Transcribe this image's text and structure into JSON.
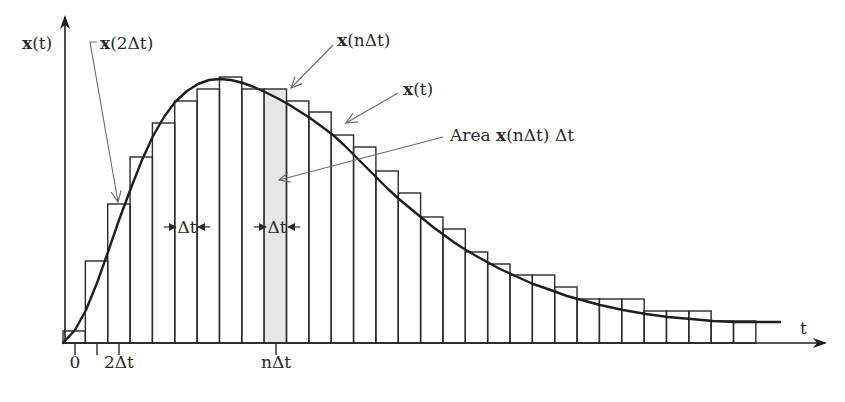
{
  "figure": {
    "colors": {
      "stroke": "#2a2a2a",
      "curve": "#1e1e1e",
      "leader": "#6a6a6a",
      "highlight_fill": "#e6e6e6",
      "background": "#ffffff"
    },
    "axes": {
      "y_label_bold": "x",
      "y_label_rest": "(t)",
      "x_label": "t",
      "origin": [
        63,
        343
      ],
      "x_end": 825,
      "y_end": 17
    },
    "ticks": [
      {
        "x": 75,
        "label": "0"
      },
      {
        "x": 97,
        "label": ""
      },
      {
        "x": 119,
        "label": "2Δt"
      },
      {
        "x": 276,
        "label": "nΔt"
      }
    ],
    "bar_width": 22.35,
    "bar_start_x": 63,
    "bar_tops": [
      331,
      261,
      204,
      157,
      123,
      101,
      89,
      77,
      89,
      89,
      101,
      112,
      135,
      147,
      171,
      193,
      217,
      229,
      252,
      264,
      275,
      275,
      287,
      299,
      299,
      299,
      311,
      311,
      311,
      321,
      321
    ],
    "highlight_bar_index": 9,
    "curve_points": [
      [
        63,
        343
      ],
      [
        75,
        330
      ],
      [
        86,
        310
      ],
      [
        97,
        283
      ],
      [
        108,
        252
      ],
      [
        119,
        220
      ],
      [
        131,
        188
      ],
      [
        142,
        160
      ],
      [
        153,
        136
      ],
      [
        164,
        117
      ],
      [
        175,
        102
      ],
      [
        187,
        91
      ],
      [
        198,
        84
      ],
      [
        209,
        80
      ],
      [
        220,
        79
      ],
      [
        231,
        80
      ],
      [
        243,
        83
      ],
      [
        254,
        87
      ],
      [
        265,
        92
      ],
      [
        277,
        98
      ],
      [
        288,
        104
      ],
      [
        299,
        111
      ],
      [
        310,
        118
      ],
      [
        321,
        126
      ],
      [
        333,
        135
      ],
      [
        344,
        145
      ],
      [
        355,
        156
      ],
      [
        366,
        167
      ],
      [
        377,
        178
      ],
      [
        388,
        189
      ],
      [
        399,
        199
      ],
      [
        411,
        209
      ],
      [
        422,
        218
      ],
      [
        433,
        227
      ],
      [
        444,
        235
      ],
      [
        455,
        243
      ],
      [
        466,
        250
      ],
      [
        478,
        257
      ],
      [
        489,
        263
      ],
      [
        500,
        269
      ],
      [
        511,
        274
      ],
      [
        522,
        279
      ],
      [
        533,
        284
      ],
      [
        545,
        288
      ],
      [
        556,
        292
      ],
      [
        567,
        296
      ],
      [
        578,
        299
      ],
      [
        600,
        305
      ],
      [
        623,
        310
      ],
      [
        646,
        314
      ],
      [
        668,
        317
      ],
      [
        691,
        319
      ],
      [
        713,
        321
      ],
      [
        735,
        322
      ],
      [
        757,
        322
      ],
      [
        780,
        322
      ]
    ],
    "annotations": {
      "x2dt": {
        "bold": "x",
        "rest": "(2Δt)"
      },
      "xndt": {
        "bold": "x",
        "rest": "(nΔt)"
      },
      "xt": {
        "bold": "x",
        "rest": "(t)"
      },
      "area": {
        "prefix": "Area ",
        "bold": "x",
        "rest": "(nΔt) Δt"
      },
      "delta_markers": [
        {
          "label": "Δt",
          "center_x": 187,
          "y": 227
        },
        {
          "label": "Δt",
          "center_x": 277,
          "y": 227
        }
      ]
    }
  }
}
